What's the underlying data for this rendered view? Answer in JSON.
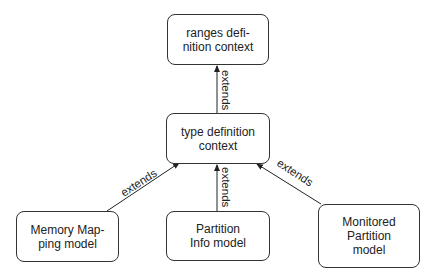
{
  "nodes": {
    "ranges": {
      "line1": "ranges defi-",
      "line2": "nition context"
    },
    "type": {
      "line1": "type definition",
      "line2": "context"
    },
    "memory": {
      "line1": "Memory Map-",
      "line2": "ping model"
    },
    "partition": {
      "line1": "Partition",
      "line2": "Info model"
    },
    "monitored": {
      "line1": "Monitored",
      "line2": "Partition",
      "line3": "model"
    }
  },
  "edges": {
    "type_to_ranges": "extends",
    "memory_to_type": "extends",
    "partition_to_type": "extends",
    "monitored_to_type": "extends"
  }
}
